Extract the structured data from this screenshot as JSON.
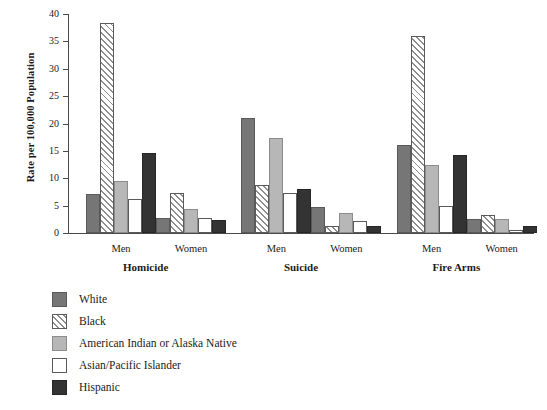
{
  "chart_data": {
    "type": "bar",
    "title": "",
    "xlabel": "",
    "ylabel": "Rate per 100,000 Population",
    "ylim": [
      0,
      40
    ],
    "yticks": [
      0,
      5,
      10,
      15,
      20,
      25,
      30,
      35,
      40
    ],
    "grid": false,
    "legend_position": "below-left",
    "groups": [
      {
        "category": "Homicide",
        "sexes": [
          "Men",
          "Women"
        ]
      },
      {
        "category": "Suicide",
        "sexes": [
          "Men",
          "Women"
        ]
      },
      {
        "category": "Fire Arms",
        "sexes": [
          "Men",
          "Women"
        ]
      }
    ],
    "categories": [
      "Homicide Men",
      "Homicide Women",
      "Suicide Men",
      "Suicide Women",
      "Fire Arms Men",
      "Fire Arms Women"
    ],
    "series": [
      {
        "name": "White",
        "pattern": "solid-medium-gray",
        "color": "#767676",
        "values": [
          7.2,
          2.8,
          21.0,
          4.8,
          16.1,
          2.5
        ]
      },
      {
        "name": "Black",
        "pattern": "diagonal-hatch",
        "color": "#ffffff",
        "values": [
          38.4,
          7.3,
          8.8,
          1.2,
          36.0,
          3.2
        ]
      },
      {
        "name": "American Indian or Alaska Native",
        "pattern": "solid-light-gray",
        "color": "#b7b7b7",
        "values": [
          9.5,
          4.3,
          17.3,
          3.6,
          12.4,
          2.5
        ]
      },
      {
        "name": "Asian/Pacific Islander",
        "pattern": "solid-white",
        "color": "#ffffff",
        "values": [
          6.3,
          2.7,
          7.4,
          2.2,
          5.0,
          0.5
        ]
      },
      {
        "name": "Hispanic",
        "pattern": "solid-dark-gray",
        "color": "#333333",
        "values": [
          14.7,
          2.4,
          8.0,
          1.2,
          14.3,
          1.2
        ]
      }
    ]
  },
  "legend": {
    "items": [
      {
        "label": "White",
        "swatch": "sw-white"
      },
      {
        "label": "Black",
        "swatch": "sw-black"
      },
      {
        "label": "American Indian or Alaska Native",
        "swatch": "sw-aian"
      },
      {
        "label": "Asian/Pacific Islander",
        "swatch": "sw-asian"
      },
      {
        "label": "Hispanic",
        "swatch": "sw-hispanic"
      }
    ]
  }
}
